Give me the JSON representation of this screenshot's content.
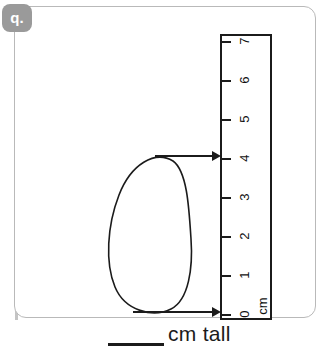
{
  "badge": {
    "label": "q.",
    "color": "#9a9a9a"
  },
  "worksheet": {
    "border_color": "#b9b9b9",
    "background": "#ffffff"
  },
  "ruler": {
    "unit_label": "cm",
    "ink_color": "#1b1b1b",
    "ticks": [
      {
        "value": "7"
      },
      {
        "value": "6"
      },
      {
        "value": "5"
      },
      {
        "value": "4"
      },
      {
        "value": "3"
      },
      {
        "value": "2"
      },
      {
        "value": "1"
      },
      {
        "value": "0"
      }
    ],
    "min": 0,
    "max": 7
  },
  "object": {
    "name": "egg-outline",
    "top_reading": "4",
    "bottom_reading": "0",
    "measured_height": "4"
  },
  "arrows": [
    {
      "name": "top-measurement-arrow",
      "points_to": "4"
    },
    {
      "name": "bottom-measurement-arrow",
      "points_to": "0"
    }
  ],
  "answer": {
    "blank": "",
    "suffix": "cm tall"
  }
}
